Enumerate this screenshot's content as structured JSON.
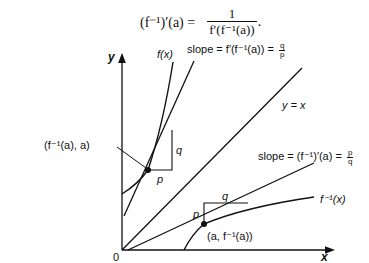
{
  "formula": {
    "lhs": "(f⁻¹)′(a) =",
    "numerator": "1",
    "denominator": "f′(f⁻¹(a))",
    "trailing": "."
  },
  "diagram": {
    "axes": {
      "x_label": "x",
      "y_label": "y",
      "origin_label": "0"
    },
    "curves": {
      "f_label": "f(x)",
      "finv_label": "f⁻¹(x)",
      "identity_label": "y = x"
    },
    "points": {
      "upper_point_label": "(f⁻¹(a), a)",
      "lower_point_label": "(a, f⁻¹(a))"
    },
    "upper_triangle": {
      "p": "p",
      "q": "q"
    },
    "lower_triangle": {
      "p": "p",
      "q": "q"
    },
    "slope_labels": {
      "upper_prefix": "slope = f′(f⁻¹(a)) =",
      "upper_num": "q",
      "upper_den": "p",
      "lower_prefix": "slope = (f⁻¹)′(a) =",
      "lower_num": "p",
      "lower_den": "q"
    },
    "colors": {
      "ink": "#111111",
      "background": "#ffffff"
    }
  }
}
